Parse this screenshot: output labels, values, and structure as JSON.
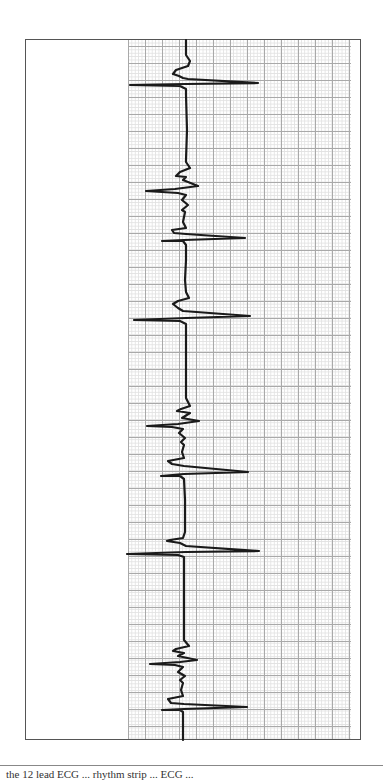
{
  "figure": {
    "orientation": "vertical rhythm strip (time runs top to bottom)",
    "stroke_color": "#1a1a1a",
    "grid_major_color": "#a9a9a9",
    "grid_minor_color": "#e2e2e2",
    "frame_color": "#555555",
    "baseline_x": 186
  },
  "caption": {
    "text": "the 12 lead ECG  ...  rhythm strip  ...  ECG ..."
  },
  "chart_data": {
    "type": "line",
    "title": "",
    "xlabel": "",
    "ylabel": "",
    "grid": true,
    "beats": [
      {
        "index": 1,
        "qrs_y": 57,
        "type": "normal"
      },
      {
        "index": 2,
        "qrs_y": 213,
        "type": "fibrillatory/irregular with deep S"
      },
      {
        "index": 3,
        "qrs_y": 320,
        "type": "normal"
      },
      {
        "index": 4,
        "qrs_y": 447,
        "type": "fibrillatory/irregular with deep S"
      },
      {
        "index": 5,
        "qrs_y": 552,
        "type": "normal"
      },
      {
        "index": 6,
        "qrs_y": 708,
        "type": "fibrillatory/irregular with deep S"
      }
    ]
  },
  "trace": {
    "path": "M186,40 L186,55 L190,61 L188,66 L176,70 L173,74 L179,76 L183,78 L188,79 L258,83 L186,84 L130,85 L180,86 L186,89 L186,95 L187,130 L186,160 L186,162 L190,168 L180,172 L176,176 L186,177 L183,180 L198,186 L175,189 L146,191 L178,193 L186,195 L182,200 L188,205 L182,210 L185,212 L183,222 L186,228 L172,230 L174,233 L186,234 L245,238 L184,240 L162,241 L183,241 L186,245 L186,260 L185,280 L186,292 L189,298 L178,301 L173,304 L178,308 L183,311 L250,316 L186,318 L134,320 L180,321 L186,324 L186,330 L186,365 L186,390 L186,398 L190,406 L181,409 L177,411 L190,413 L182,418 L199,421 L178,424 L147,426 L172,427 L183,429 L179,433 L185,438 L181,442 L184,445 L182,452 L184,458 L168,461 L172,464 L184,466 L248,472 L184,474 L161,476 L180,476 L184,479 L185,500 L185,525 L185,532 L183,538 L170,540 L167,541 L180,543 L186,546 L259,551 L186,552 L127,554 L178,555 L184,557 L184,565 L184,600 L184,630 L184,640 L189,646 L176,649 L173,651 L184,653 L178,656 L197,660 L180,662 L150,664 L175,665 L183,667 L178,672 L185,676 L180,680 L183,683 L181,690 L183,696 L168,699 L171,703 L184,704 L247,707 L184,709 L162,710 L180,710 L183,712 L183,740"
  }
}
